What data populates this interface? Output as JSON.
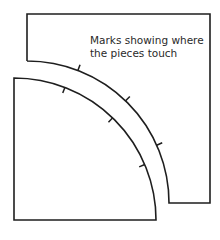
{
  "diagram": {
    "caption_lines": [
      "Marks showing where",
      "the pieces touch"
    ],
    "stroke_color": "#1e1e1e",
    "outer_piece": {
      "top": 14,
      "left": 27,
      "right": 210,
      "bottom": 203,
      "arc_center": [
        27,
        203
      ],
      "arc_radius": 142,
      "tick_angles_deg": [
        21,
        44,
        66
      ]
    },
    "inner_piece": {
      "top": 78,
      "left": 14,
      "bottom": 220,
      "arc_center": [
        14,
        220
      ],
      "arc_radius": 142,
      "tick_angles_deg": [
        21,
        44,
        67
      ]
    }
  }
}
